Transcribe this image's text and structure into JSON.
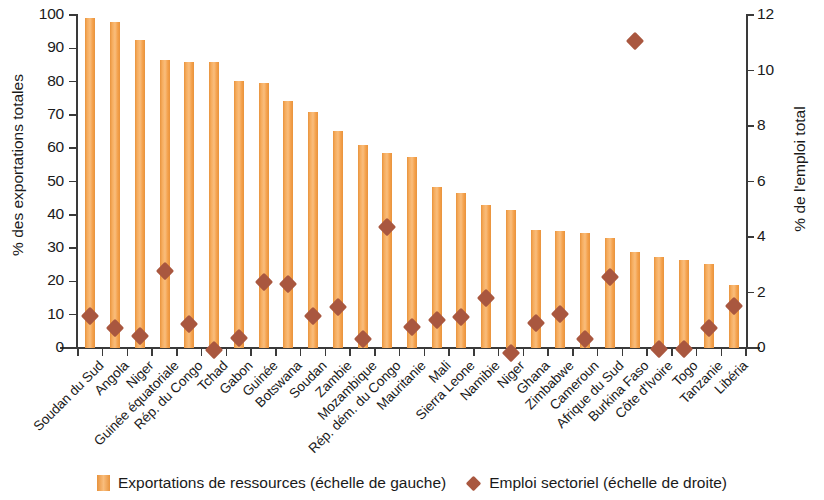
{
  "chart_data": {
    "type": "bar",
    "title": "",
    "subtitle": "",
    "xlabel": "",
    "ylabel": "% des exportations totales",
    "y2label": "% de l'emploi total",
    "ylim": [
      0,
      100
    ],
    "y2lim": [
      0,
      12
    ],
    "yticks": [
      0,
      10,
      20,
      30,
      40,
      50,
      60,
      70,
      80,
      90,
      100
    ],
    "y2ticks": [
      0,
      2,
      4,
      6,
      8,
      10,
      12
    ],
    "grid": false,
    "legend_position": "bottom",
    "categories": [
      "Soudan du Sud",
      "Angola",
      "Niger",
      "Guinée équatoriale",
      "Rép. du Congo",
      "Tchad",
      "Gabon",
      "Guinée",
      "Botswana",
      "Soudan",
      "Zambie",
      "Mozambique",
      "Rép. dém. du Congo",
      "Mauritanie",
      "Mali",
      "Sierra Leone",
      "Namibie",
      "Niger",
      "Ghana",
      "Zimbabwe",
      "Cameroun",
      "Afrique du Sud",
      "Burkina Faso",
      "Côte d'Ivoire",
      "Togo",
      "Tanzanie",
      "Libéria"
    ],
    "series": [
      {
        "name": "Exportations de ressources (échelle de gauche)",
        "type": "bar",
        "axis": "left",
        "color": "#f3a14b",
        "values": [
          99,
          98,
          92.5,
          86.5,
          86,
          85.8,
          80.3,
          79.5,
          74.3,
          70.8,
          65.3,
          61,
          58.5,
          57.5,
          48.5,
          46.5,
          42.8,
          41.5,
          35.5,
          35,
          34.5,
          33,
          28.8,
          27.3,
          26.3,
          25.3,
          19
        ]
      },
      {
        "name": "Emploi sectoriel (échelle de droite)",
        "type": "scatter",
        "axis": "right",
        "marker": "diamond",
        "color": "#a9573f",
        "values": [
          1.4,
          0.95,
          0.65,
          3.0,
          1.1,
          0.15,
          0.6,
          2.6,
          2.55,
          1.4,
          1.7,
          0.55,
          4.6,
          1.0,
          1.25,
          1.35,
          2.05,
          0.05,
          1.15,
          1.45,
          0.55,
          2.8,
          11.3,
          0.2,
          0.2,
          0.95,
          1.75
        ]
      }
    ]
  },
  "axes": {
    "left_title": "% des exportations totales",
    "right_title": "% de l'emploi total"
  },
  "legend": {
    "items": [
      {
        "label": "Exportations de ressources (échelle de gauche)",
        "marker": "bar-swatch"
      },
      {
        "label": "Emploi sectoriel (échelle de droite)",
        "marker": "diamond-swatch"
      }
    ]
  }
}
